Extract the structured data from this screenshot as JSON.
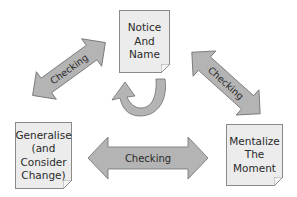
{
  "diagram": {
    "nodes": [
      {
        "id": "notice",
        "lines": [
          "Notice",
          "And",
          "Name"
        ]
      },
      {
        "id": "generalise",
        "lines": [
          "Generalise",
          "(and",
          "Consider",
          "Change)"
        ]
      },
      {
        "id": "mentalize",
        "lines": [
          "Mentalize",
          "The",
          "Moment"
        ]
      }
    ],
    "edges": [
      {
        "from": "generalise",
        "to": "notice",
        "label": "Checking",
        "type": "bidirectional"
      },
      {
        "from": "notice",
        "to": "mentalize",
        "label": "Checking",
        "type": "bidirectional"
      },
      {
        "from": "generalise",
        "to": "mentalize",
        "label": "Checking",
        "type": "bidirectional"
      },
      {
        "from": "notice",
        "to": "notice",
        "label": "",
        "type": "self-loop"
      }
    ],
    "colors": {
      "arrow_fill": "#b4b4b4",
      "arrow_stroke": "#6e6e6e",
      "note_fill": "#ececec",
      "note_stroke": "#8a8a8a",
      "text": "#2a2a2a"
    }
  }
}
